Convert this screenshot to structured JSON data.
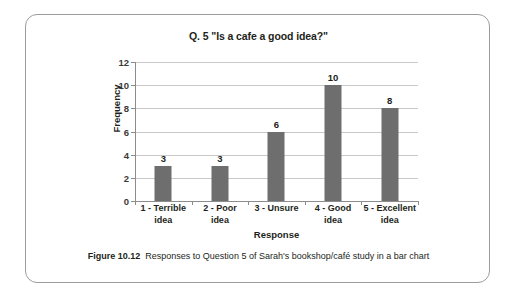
{
  "figure": {
    "caption_number": "Figure 10.12",
    "caption_text": "Responses to Question 5 of Sarah's bookshop/café study in a bar chart",
    "border_color": "#9c9c9c",
    "background_color": "#ffffff"
  },
  "chart_data": {
    "type": "bar",
    "title": "Q. 5 \"Is a cafe a good idea?\"",
    "xlabel": "Response",
    "ylabel": "Frequency",
    "categories": [
      "1 - Terrible idea",
      "2 - Poor idea",
      "3 - Unsure",
      "4 - Good idea",
      "5 - Excellent idea"
    ],
    "category_lines": [
      [
        "1 - Terrible",
        "idea"
      ],
      [
        "2 - Poor",
        "idea"
      ],
      [
        "3 - Unsure"
      ],
      [
        "4 - Good",
        "idea"
      ],
      [
        "5 - Excellent",
        "idea"
      ]
    ],
    "values": [
      3,
      3,
      6,
      10,
      8
    ],
    "value_labels": [
      "3",
      "3",
      "6",
      "10",
      "8"
    ],
    "ylim": [
      0,
      12
    ],
    "ytick_step": 2,
    "yticks": [
      0,
      2,
      4,
      6,
      8,
      10,
      12
    ],
    "ytick_labels": [
      "0",
      "2",
      "4",
      "6",
      "8",
      "10",
      "12"
    ],
    "grid": true,
    "grid_axis": "y",
    "grid_color": "#c9c9c9",
    "legend": false,
    "bar_color": "#6e6e6e",
    "axis_color": "#8c8c8c"
  }
}
